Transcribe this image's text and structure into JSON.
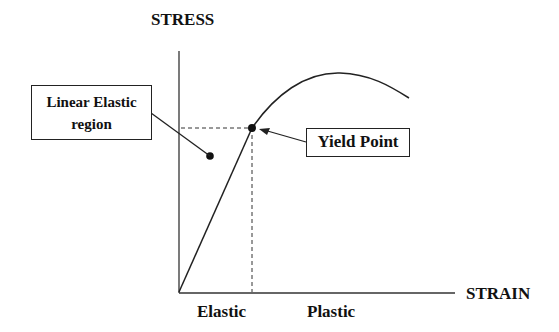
{
  "axes": {
    "y_label": "STRESS",
    "x_label": "STRAIN"
  },
  "regions": {
    "elastic": "Elastic",
    "plastic": "Plastic"
  },
  "annotations": {
    "linear_elastic_line1": "Linear Elastic",
    "linear_elastic_line2": "region",
    "yield_point": "Yield Point"
  },
  "colors": {
    "line": "#222222",
    "background": "#ffffff"
  }
}
